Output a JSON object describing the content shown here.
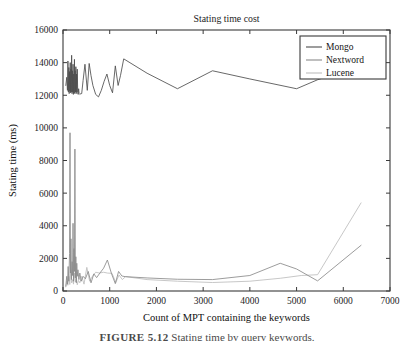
{
  "figure": {
    "caption_label": "FIGURE 5.12",
    "caption_text": "Stating time by query keywords."
  },
  "chart_data": {
    "type": "line",
    "title": "Stating time cost",
    "xlabel": "Count of MPT containing the keywords",
    "ylabel": "Stating time (ms)",
    "xlim": [
      0,
      7000
    ],
    "ylim": [
      0,
      16000
    ],
    "xticks": [
      0,
      1000,
      2000,
      3000,
      4000,
      5000,
      6000,
      7000
    ],
    "yticks": [
      0,
      2000,
      4000,
      6000,
      8000,
      10000,
      12000,
      14000,
      16000
    ],
    "grid": false,
    "legend_position": "upper right",
    "legend": [
      "Mongo",
      "Nextword",
      "Lucene"
    ],
    "colors": {
      "Mongo": "#4d4d4d",
      "Nextword": "#8a8a8a",
      "Lucene": "#bdbdbd"
    },
    "series": [
      {
        "name": "Mongo",
        "color": "#4d4d4d",
        "x": [
          60,
          80,
          95,
          105,
          115,
          125,
          132,
          140,
          148,
          155,
          162,
          170,
          178,
          185,
          193,
          200,
          208,
          215,
          222,
          230,
          238,
          245,
          252,
          260,
          268,
          275,
          283,
          290,
          298,
          305,
          315,
          325,
          335,
          345,
          360,
          380,
          400,
          430,
          470,
          520,
          560,
          600,
          640,
          700,
          760,
          820,
          880,
          940,
          1000,
          1060,
          1120,
          1180,
          1230,
          1300,
          1800,
          2450,
          3200,
          4000,
          5000,
          5450,
          6380
        ],
        "y": [
          12600,
          13100,
          12300,
          14100,
          12200,
          13700,
          12100,
          13450,
          12250,
          14000,
          12150,
          13600,
          12200,
          14450,
          12100,
          13500,
          12200,
          13900,
          12050,
          13300,
          12150,
          14200,
          12100,
          13500,
          12200,
          13750,
          12100,
          13300,
          12200,
          13600,
          12150,
          12050,
          12400,
          12100,
          12050,
          12100,
          12100,
          12900,
          13900,
          12300,
          13950,
          13200,
          12600,
          12050,
          11900,
          12300,
          12850,
          13300,
          12600,
          12150,
          13800,
          12600,
          13200,
          14230,
          13350,
          12400,
          13500,
          13000,
          12400,
          12950,
          13820
        ]
      },
      {
        "name": "Nextword",
        "color": "#8a8a8a",
        "x": [
          60,
          80,
          95,
          110,
          125,
          140,
          150,
          160,
          170,
          180,
          195,
          205,
          215,
          225,
          235,
          245,
          255,
          265,
          275,
          285,
          295,
          305,
          320,
          340,
          360,
          390,
          430,
          480,
          540,
          600,
          660,
          720,
          790,
          870,
          950,
          1040,
          1120,
          1190,
          1260,
          1330,
          1800,
          2450,
          3200,
          4000,
          4650,
          5000,
          5450,
          6380
        ],
        "y": [
          300,
          900,
          420,
          1500,
          600,
          2300,
          9700,
          1100,
          3200,
          700,
          1800,
          950,
          4150,
          600,
          2600,
          1200,
          8700,
          800,
          2100,
          500,
          1700,
          900,
          1300,
          700,
          1100,
          600,
          900,
          750,
          1200,
          500,
          1050,
          820,
          1100,
          1400,
          1900,
          1050,
          450,
          1200,
          920,
          880,
          800,
          720,
          700,
          950,
          1700,
          1350,
          620,
          2800
        ]
      },
      {
        "name": "Lucene",
        "color": "#bdbdbd",
        "x": [
          60,
          85,
          105,
          125,
          145,
          165,
          185,
          205,
          225,
          245,
          265,
          285,
          305,
          330,
          360,
          400,
          450,
          510,
          570,
          630,
          700,
          780,
          870,
          950,
          1050,
          1130,
          1200,
          1270,
          1340,
          1800,
          2450,
          3200,
          4000,
          4650,
          5100,
          5450,
          6380
        ],
        "y": [
          250,
          600,
          350,
          900,
          400,
          1250,
          500,
          700,
          420,
          1100,
          550,
          800,
          380,
          650,
          500,
          900,
          420,
          1450,
          600,
          900,
          1150,
          1100,
          1150,
          1100,
          1080,
          520,
          980,
          700,
          880,
          700,
          600,
          520,
          600,
          780,
          950,
          1000,
          5400
        ]
      }
    ]
  }
}
